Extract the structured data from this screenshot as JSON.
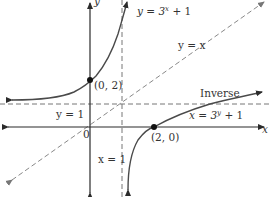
{
  "figure": {
    "type": "function-inverse-graph",
    "curves": [
      {
        "name": "original",
        "label": "y = 3^x + 1",
        "label_base": "y = 3",
        "label_exp": "x",
        "label_tail": " + 1"
      },
      {
        "name": "inverse",
        "label": "x = 3^y + 1",
        "label_base": "x = 3",
        "label_exp": "y",
        "label_tail": " + 1",
        "caption": "Inverse"
      },
      {
        "name": "identity",
        "label": "y = x"
      }
    ],
    "asymptotes": {
      "horizontal": "y = 1",
      "vertical": "x = 1"
    },
    "points": [
      {
        "label": "(0, 2)"
      },
      {
        "label": "(2, 0)"
      }
    ],
    "axes": {
      "x_label": "x",
      "y_label": "y",
      "origin_label": "0"
    },
    "colors": {
      "curve": "#4a4a4a",
      "axis": "#2b2b2b",
      "dashed": "#888888",
      "text": "#333333"
    }
  }
}
